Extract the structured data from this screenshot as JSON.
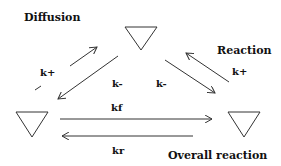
{
  "labels": {
    "diffusion": "Diffusion",
    "reaction": "Reaction",
    "overall_reaction": "Overall reaction"
  },
  "rate_constants": {
    "diffusion_forward": "k+",
    "diffusion_reverse": "k-",
    "reaction_reverse": "k-",
    "reaction_forward": "k+",
    "overall_forward": "kf",
    "overall_reverse": "kr"
  },
  "nodes": [
    {
      "id": "top",
      "shape": "inverted-triangle"
    },
    {
      "id": "left",
      "shape": "inverted-triangle"
    },
    {
      "id": "right",
      "shape": "inverted-triangle"
    }
  ],
  "colors": {
    "stroke": "#333333",
    "text": "#111111",
    "background": "#ffffff"
  }
}
